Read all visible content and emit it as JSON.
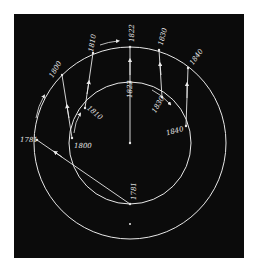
{
  "figure": {
    "background": "#0b0b0b",
    "line_color": "#e8e8e8",
    "outer_orbit": {
      "cx": 130,
      "cy": 143,
      "r": 96
    },
    "inner_orbit": {
      "cx": 130,
      "cy": 143,
      "r": 61
    },
    "outer_labels": [
      "1781",
      "1800",
      "1810",
      "1822",
      "1830",
      "1840"
    ],
    "inner_labels": [
      "1781",
      "1800",
      "1810",
      "1822",
      "1830",
      "1840"
    ]
  },
  "labels": {
    "outer_1781": "1781",
    "outer_1800": "1800",
    "outer_1810": "1810",
    "outer_1822": "1822",
    "outer_1830": "1830",
    "outer_1840": "1840",
    "inner_1781": "1781",
    "inner_1800": "1800",
    "inner_1810": "1810",
    "inner_1822": "1822",
    "inner_1830": "1830",
    "inner_1840": "1840"
  }
}
